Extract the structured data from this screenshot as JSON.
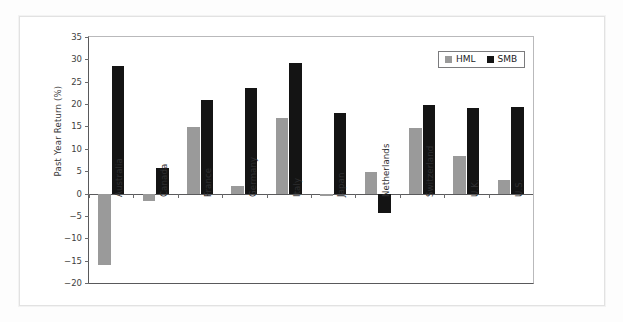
{
  "chart_data": {
    "type": "bar",
    "title": "",
    "xlabel": "",
    "ylabel": "Past Year Return (%)",
    "ylim": [
      -20,
      35
    ],
    "ytick_step": 5,
    "yticks": [
      35,
      30,
      25,
      20,
      15,
      10,
      5,
      0,
      -5,
      -10,
      -15,
      -20
    ],
    "ytick_labels": [
      "35",
      "30",
      "25",
      "20",
      "15",
      "10",
      "5",
      "0",
      "−5",
      "−10",
      "−15",
      "−20"
    ],
    "grid": false,
    "legend_position": "top-right-inside",
    "categories": [
      "Australia",
      "Canada",
      "France",
      "Germany",
      "Italy",
      "Japan",
      "Netherlands",
      "Switzerland",
      "U.K.",
      "U.S."
    ],
    "series": [
      {
        "name": "HML",
        "color": "#9a9a9a",
        "values": [
          -16.0,
          -1.6,
          14.9,
          1.7,
          17.0,
          -0.5,
          4.8,
          14.7,
          8.5,
          3.1
        ]
      },
      {
        "name": "SMB",
        "color": "#141414",
        "values": [
          28.5,
          5.7,
          21.0,
          23.7,
          29.2,
          18.0,
          -4.3,
          19.8,
          19.2,
          19.4
        ]
      }
    ]
  },
  "legend": {
    "items": [
      {
        "label": "HML",
        "color": "#9a9a9a"
      },
      {
        "label": "SMB",
        "color": "#141414"
      }
    ]
  },
  "axes": {
    "y_title": "Past Year Return (%)"
  }
}
